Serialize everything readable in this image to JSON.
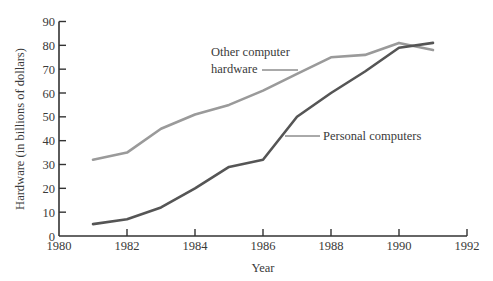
{
  "chart_data": {
    "type": "line",
    "title": "",
    "xlabel": "Year",
    "ylabel": "Hardware (in billions of dollars)",
    "xlim": [
      1980,
      1992
    ],
    "ylim": [
      0,
      90
    ],
    "x_ticks": [
      "1980",
      "1982",
      "1984",
      "1986",
      "1988",
      "1990",
      "1992"
    ],
    "y_ticks": [
      "0",
      "10",
      "20",
      "30",
      "40",
      "50",
      "60",
      "70",
      "80",
      "90"
    ],
    "grid": false,
    "legend": "inline annotations",
    "x": [
      1981,
      1982,
      1983,
      1984,
      1985,
      1986,
      1987,
      1988,
      1989,
      1990,
      1991
    ],
    "series": [
      {
        "name": "Other computer hardware",
        "color": "#9a9a9a",
        "values": [
          32,
          35,
          45,
          51,
          55,
          61,
          68,
          75,
          76,
          81,
          78
        ]
      },
      {
        "name": "Personal computers",
        "color": "#555555",
        "values": [
          5,
          7,
          12,
          20,
          29,
          32,
          50,
          60,
          69,
          79,
          81
        ]
      }
    ],
    "annotations": [
      {
        "text_line1": "Other computer",
        "text_line2": "hardware",
        "series": "Other computer hardware"
      },
      {
        "text": "Personal computers",
        "series": "Personal computers"
      }
    ]
  },
  "labels": {
    "other_line1": "Other computer",
    "other_line2": "hardware",
    "personal": "Personal computers",
    "xlabel": "Year",
    "ylabel": "Hardware (in billions of dollars)"
  }
}
